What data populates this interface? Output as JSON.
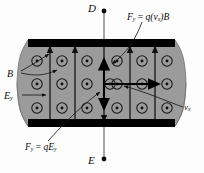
{
  "figure": {
    "type": "physics-diagram"
  },
  "terminals": {
    "top": {
      "label": "D",
      "marker": "filled-dot"
    },
    "bottom": {
      "label": "E",
      "marker": "filled-dot"
    }
  },
  "labels": {
    "magnetic_field": {
      "symbol": "B",
      "text": "B"
    },
    "electric_field": {
      "symbol": "E",
      "subscript": "y",
      "text": "Ey"
    },
    "drift_velocity": {
      "symbol": "v",
      "subscript": "x",
      "text": "vx"
    },
    "magnetic_force": {
      "lhs_symbol": "F",
      "lhs_subscript": "y",
      "equals": "=",
      "rhs": "q(vx)B",
      "text": "Fy = q(vx)B"
    },
    "electric_force": {
      "lhs_symbol": "F",
      "lhs_subscript": "y",
      "equals": "=",
      "rhs": "qEy",
      "text": "Fy = qEy"
    }
  },
  "slab": {
    "fill_color": "#9b9b9b",
    "edge_color": "#6d6d6d",
    "plate_color": "#000000",
    "field_symbol": "circled-dot",
    "field_direction": "out-of-page",
    "rows": 3,
    "columns": 6,
    "dot_grid_note": "18 circled dots representing B out of the page"
  },
  "arrows": {
    "field_lines": {
      "count": 6,
      "color": "#111111",
      "directions": [
        "up",
        "up",
        "up",
        "up",
        "up",
        "down"
      ]
    },
    "center_force_up": {
      "direction": "up",
      "color": "#000000"
    },
    "center_force_down": {
      "direction": "down",
      "color": "#000000"
    },
    "center_velocity": {
      "direction": "right",
      "color": "#000000"
    }
  },
  "colors": {
    "background": "#fdfdfd",
    "slab_gray": "#9b9b9b",
    "plate_black": "#000000",
    "ink": "#0b0b0b"
  }
}
